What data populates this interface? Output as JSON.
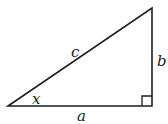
{
  "diagram": {
    "type": "right-triangle",
    "top_partial_text": "",
    "vertices": {
      "bottom_left": [
        8,
        106
      ],
      "bottom_right": [
        152,
        106
      ],
      "top_right": [
        152,
        8
      ]
    },
    "right_angle_marker": {
      "x": 142,
      "y": 96,
      "size": 10
    },
    "labels": {
      "hypotenuse": "c",
      "base": "a",
      "height": "b",
      "angle": "x"
    },
    "stroke_color": "#1e1e1e",
    "stroke_width": 1.6
  }
}
